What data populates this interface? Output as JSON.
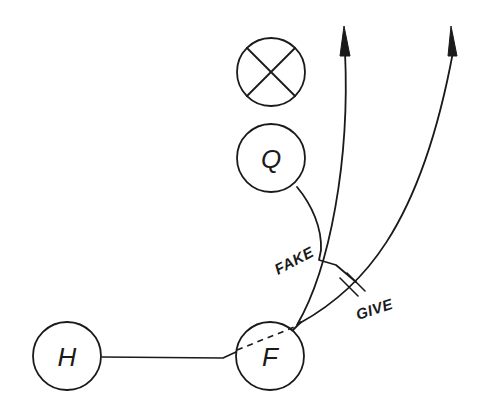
{
  "diagram": {
    "type": "football play diagram",
    "background": "#ffffff",
    "ink_color": "#1a1a1a",
    "players": [
      {
        "id": "defender",
        "symbol": "X-in-circle",
        "label": "",
        "cx": 271,
        "cy": 72
      },
      {
        "id": "quarterback",
        "symbol": "circle",
        "label": "Q",
        "cx": 271,
        "cy": 158
      },
      {
        "id": "halfback",
        "symbol": "circle",
        "label": "H",
        "cx": 67,
        "cy": 356
      },
      {
        "id": "fullback",
        "symbol": "circle",
        "label": "F",
        "cx": 270,
        "cy": 356
      }
    ],
    "annotations": {
      "fake": "FAKE",
      "give": "GIVE"
    },
    "paths": [
      {
        "id": "halfback-route",
        "from": "H",
        "to": "F",
        "style": "solid"
      },
      {
        "id": "fullback-fake-path",
        "from": "F",
        "style": "dashed"
      },
      {
        "id": "quarterback-path",
        "from": "Q",
        "to": "handoff",
        "style": "solid"
      },
      {
        "id": "route-inside",
        "from": "F",
        "direction": "upfield",
        "arrow": true
      },
      {
        "id": "route-outside",
        "from": "F",
        "direction": "upfield-right",
        "arrow": true
      }
    ]
  }
}
